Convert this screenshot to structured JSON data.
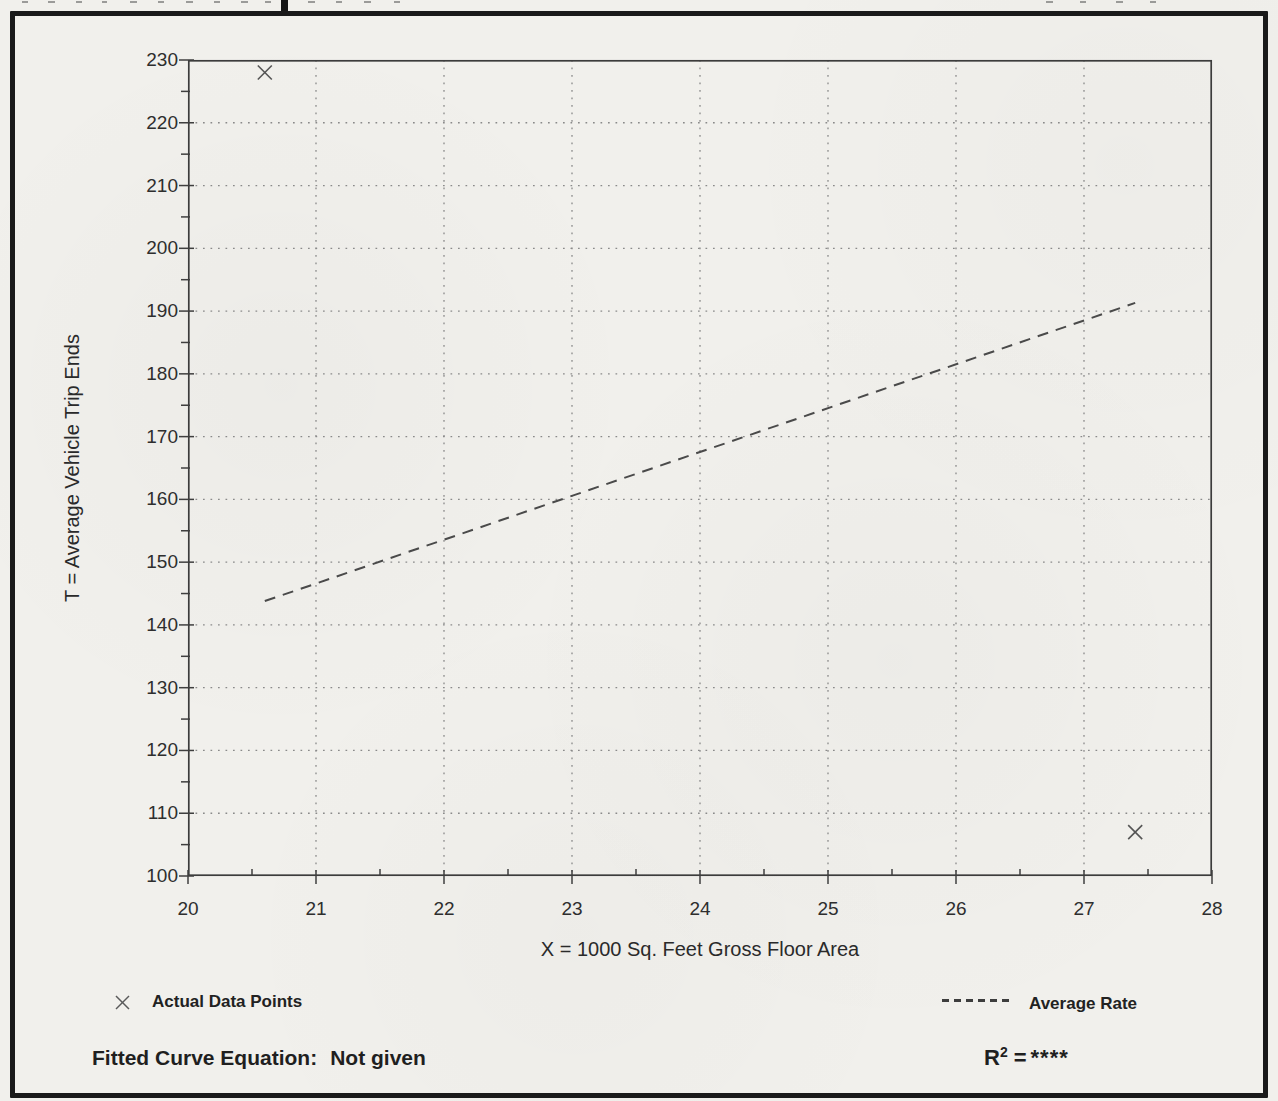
{
  "page": {
    "background_color": "#f1f0ec",
    "border_color": "#1a1a1a",
    "ink_color": "#2b2b2b",
    "grid_color": "#8a8a8a"
  },
  "chart_data": {
    "type": "scatter",
    "title": "",
    "xlabel": "X = 1000 Sq. Feet Gross Floor Area",
    "ylabel": "T = Average Vehicle Trip Ends",
    "xlim": [
      20,
      28
    ],
    "ylim": [
      100,
      230
    ],
    "x_major_step": 1,
    "x_minor_step": 0.5,
    "y_major_step": 10,
    "y_minor_step": 5,
    "grid": "dotted-lines-at-every-major-tick",
    "points": [
      {
        "x": 20.6,
        "y": 228
      },
      {
        "x": 27.4,
        "y": 107
      }
    ],
    "average_rate_line": {
      "x1": 20.6,
      "y1": 143.8,
      "x2": 27.4,
      "y2": 191.3
    },
    "legend": {
      "position": "below-chart",
      "entries": [
        {
          "marker": "x",
          "label": "Actual Data Points"
        },
        {
          "marker": "dashed-line",
          "label": "Average Rate"
        }
      ]
    }
  },
  "footer": {
    "fitted_curve_label": "Fitted Curve Equation:",
    "fitted_curve_value": "Not given",
    "r_squared_base": "R",
    "r_squared_exponent": "2",
    "r_squared_equals": "=",
    "r_squared_value": "****"
  }
}
